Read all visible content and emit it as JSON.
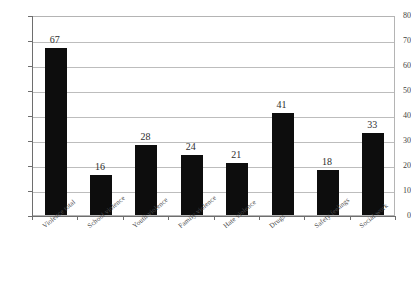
{
  "chart_data": {
    "type": "bar",
    "title": "",
    "subtitle": "",
    "xlabel": "",
    "ylabel": "",
    "categories": [
      "Violence total",
      "School violence",
      "Youth violence",
      "Family violence",
      "Hate violence",
      "Drugs",
      "Safety feelings",
      "Social work"
    ],
    "values": [
      67,
      16,
      28,
      24,
      21,
      41,
      18,
      33
    ],
    "ylim": [
      0,
      80
    ],
    "ytick_labels": [
      "0",
      "10",
      "20",
      "30",
      "40",
      "50",
      "60",
      "70",
      "80"
    ],
    "ytick_values": [
      0,
      10,
      20,
      30,
      40,
      50,
      60,
      70,
      80
    ],
    "grid": true,
    "grid_axis": "y",
    "legend": false,
    "legend_position": "none",
    "data_labels": true,
    "series": [
      {
        "name": "Count",
        "values": [
          67,
          16,
          28,
          24,
          21,
          41,
          18,
          33
        ],
        "color": "#0d0d0d"
      }
    ],
    "colors": {
      "bar": "#0d0d0d",
      "gridline": "#bdbdbd",
      "axis": "#6e6e6e",
      "plot_border": "#b4b4b4",
      "text": "#3a3a3a",
      "background": "#ffffff"
    }
  }
}
